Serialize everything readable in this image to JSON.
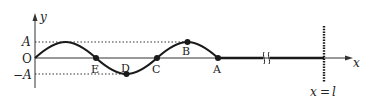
{
  "diagram": {
    "type": "transverse-wave-on-string",
    "axes": {
      "x_label": "x",
      "y_label": "y",
      "origin_label": "O",
      "amplitude_label": "A",
      "neg_amplitude_label": "−A"
    },
    "points": [
      {
        "label": "E",
        "position": "zero-crossing"
      },
      {
        "label": "D",
        "position": "trough"
      },
      {
        "label": "C",
        "position": "zero-crossing"
      },
      {
        "label": "B",
        "position": "crest"
      },
      {
        "label": "A",
        "position": "wave-front"
      }
    ],
    "boundary": {
      "label_lhs": "x",
      "label_eq": "=",
      "label_rhs": "l",
      "style": "dashed-wall"
    },
    "break_symbol": "string-break-icon",
    "colors": {
      "ink": "#1a1a1a",
      "dotted_guides": "#333333"
    }
  }
}
